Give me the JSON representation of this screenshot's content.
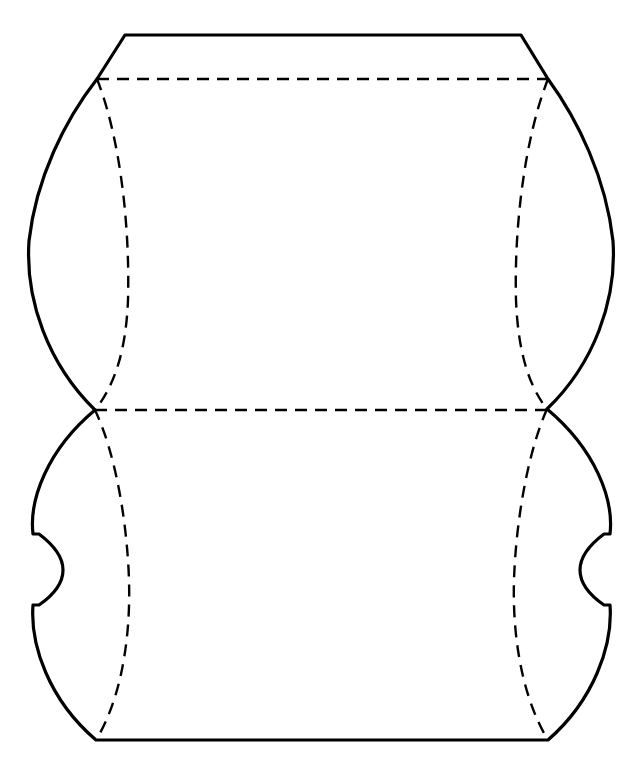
{
  "figure": {
    "kind": "technical-line-drawing",
    "canvas": {
      "width": 642,
      "height": 778,
      "background": "#ffffff"
    },
    "style": {
      "stroke_color": "#000000",
      "solid_stroke_width": 3.2,
      "dashed_stroke_width": 2.4,
      "dash_pattern": "12 8",
      "fill": "none"
    },
    "geometry": {
      "top_edge": {
        "x1": 125,
        "y1": 35,
        "x2": 521,
        "y2": 35
      },
      "bottom_edge": {
        "x1": 96,
        "y1": 740,
        "x2": 548,
        "y2": 740
      },
      "upper_fold_line": {
        "x1": 97,
        "y1": 79,
        "x2": 548,
        "y2": 79
      },
      "middle_fold_line": {
        "x1": 95,
        "y1": 410,
        "x2": 547,
        "y2": 410
      },
      "left_outer_extreme_x": 29,
      "right_outer_extreme_x": 614,
      "left_inner_dashed_extreme_x": 128,
      "right_inner_dashed_extreme_x": 516,
      "left_notch": {
        "top_y": 534,
        "bottom_y": 605,
        "edge_x": 33,
        "apex_x": 73
      },
      "right_notch": {
        "top_y": 534,
        "bottom_y": 605,
        "edge_x": 610,
        "apex_x": 570
      },
      "left_waist_vertex": {
        "x": 95,
        "y": 410
      },
      "right_waist_vertex": {
        "x": 547,
        "y": 409
      }
    },
    "paths": {
      "outline_solid": "M 125 35 L 521 35 L 548 79 C 578 120 606 178 613 241 C 617 300 594 364 547 409 C 596 450 614 500 610 534 L 604 534 C 588 546 580 558 580 570 C 580 582 588 594 604 605 L 610 605 C 613 645 594 700 548 740 L 96 740 C 49 700 30 645 33 605 L 39 605 C 55 594 63 582 63 570 C 63 558 55 546 39 534 L 33 534 C 29 500 47 450 95 410 C 48 364 25 300 29 241 C 36 178 65 120 97 79 Z",
      "upper_fold_dashed": "M 97 79 L 548 79",
      "middle_fold_dashed": "M 95 410 L 547 410",
      "left_inner_dashed": "M 97 79 C 121 140 130 230 128 300 C 126 350 115 385 95 410 C 115 452 127 520 129 580 C 131 650 117 706 96 740",
      "right_inner_dashed": "M 548 79 C 524 140 514 230 516 300 C 518 350 528 385 547 409 C 528 452 516 520 514 580 C 512 650 527 706 548 740"
    }
  }
}
